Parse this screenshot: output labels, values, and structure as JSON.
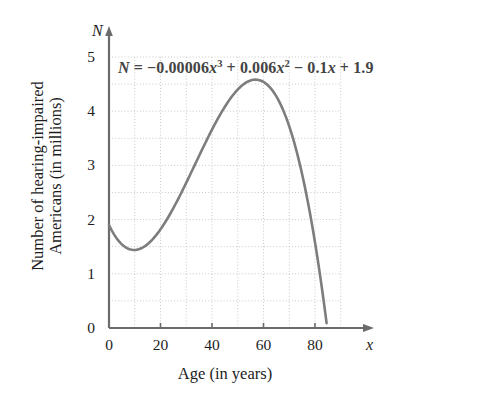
{
  "chart_data": {
    "type": "line",
    "title": "",
    "subtitle": "",
    "xlabel": "Age (in years)",
    "ylabel": "Number of hearing-impaired Americans (in millions)",
    "ylabel_line1": "Number of hearing-impaired",
    "ylabel_line2": "Americans (in millions)",
    "x_axis_name": "x",
    "y_axis_name": "N",
    "xlim": [
      0,
      90
    ],
    "ylim": [
      0,
      5
    ],
    "xticks": [
      0,
      20,
      40,
      60,
      80
    ],
    "xtick_labels": [
      "0",
      "20",
      "40",
      "60",
      "80"
    ],
    "yticks": [
      0,
      1,
      2,
      3,
      4,
      5
    ],
    "ytick_labels": [
      "0",
      "1",
      "2",
      "3",
      "4",
      "5"
    ],
    "grid": true,
    "grid_x_step": 10,
    "grid_y_step": 0.5,
    "legend": "none",
    "annotation": "N = -0.00006x^3 + 0.006x^2 - 0.1x + 1.9",
    "equation": {
      "lhs": "N",
      "equals": "=",
      "term1_coefficient": "−0.00006",
      "term1_variable": "x",
      "term1_exponent": "3",
      "op1": "+",
      "term2_coefficient": "0.006",
      "term2_variable": "x",
      "term2_exponent": "2",
      "op2": "−",
      "term3_coefficient": "0.1",
      "term3_variable": "x",
      "op3": "+",
      "constant": "1.9"
    },
    "series": [
      {
        "name": "N(x)",
        "color": "#7d7d7d",
        "x": [
          0,
          2,
          4,
          6,
          8,
          10,
          12,
          14,
          16,
          18,
          20,
          22,
          24,
          26,
          28,
          30,
          32,
          34,
          36,
          38,
          40,
          42,
          44,
          46,
          48,
          50,
          52,
          54,
          56,
          58,
          60,
          62,
          64,
          66,
          68,
          70,
          72,
          74,
          76,
          78,
          80,
          82,
          84,
          84.5
        ],
        "values": [
          1.9,
          1.72,
          1.59,
          1.5,
          1.45,
          1.44,
          1.46,
          1.52,
          1.6,
          1.72,
          1.86,
          2.03,
          2.22,
          2.44,
          2.67,
          2.92,
          3.18,
          3.45,
          3.74,
          4.03,
          4.32,
          4.62,
          4.92,
          5.22,
          5.51,
          5.8,
          6.08,
          6.34,
          6.59,
          6.83,
          7.04,
          7.22,
          7.38,
          7.51,
          7.6,
          7.65,
          7.66,
          7.63,
          7.55,
          7.43,
          7.25,
          7.02,
          6.73,
          6.57
        ]
      }
    ],
    "curve_features": {
      "y_intercept": 1.9,
      "local_minimum": {
        "x": 10,
        "y": 1.45
      },
      "local_maximum": {
        "x": 59,
        "y": 4.55
      },
      "x_intercept": 84
    }
  },
  "axes": {
    "x_arrow": true,
    "y_arrow": true,
    "line_color": "#6b6b6b",
    "grid_color": "#c9c9c9"
  }
}
